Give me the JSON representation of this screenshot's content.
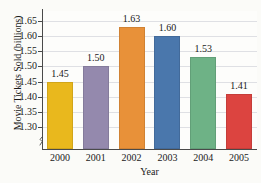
{
  "chart_data": {
    "type": "bar",
    "title": "",
    "xlabel": "Year",
    "ylabel": "Movie Tickets Sold (billions)",
    "categories": [
      "2000",
      "2001",
      "2002",
      "2003",
      "2004",
      "2005"
    ],
    "values": [
      1.45,
      1.5,
      1.63,
      1.6,
      1.53,
      1.41
    ],
    "value_labels": [
      "1.45",
      "1.50",
      "1.63",
      "1.60",
      "1.53",
      "1.41"
    ],
    "ylim": [
      1.28,
      1.67
    ],
    "y_axis_break": true,
    "y_ticks": [
      1.3,
      1.35,
      1.4,
      1.45,
      1.5,
      1.55,
      1.6,
      1.65
    ],
    "y_tick_labels": [
      "1.30",
      "1.35",
      "1.40",
      "1.45",
      "1.50",
      "1.55",
      "1.60",
      "1.65"
    ],
    "grid": true,
    "grid_axis": "y",
    "legend": false,
    "bar_colors": [
      "#E9B81D",
      "#9489AD",
      "#E89139",
      "#4A77AC",
      "#6EB286",
      "#DC4440"
    ],
    "series": [
      {
        "name": "Movie Tickets Sold (billions)",
        "values": [
          1.45,
          1.5,
          1.63,
          1.6,
          1.53,
          1.41
        ]
      }
    ],
    "colors": {
      "background": "#fbfbf8",
      "plot_background": "#fdfdfb",
      "gridline": "#dfe0e4",
      "axis": "#4a4a4a",
      "text": "#1a1a1a"
    }
  }
}
